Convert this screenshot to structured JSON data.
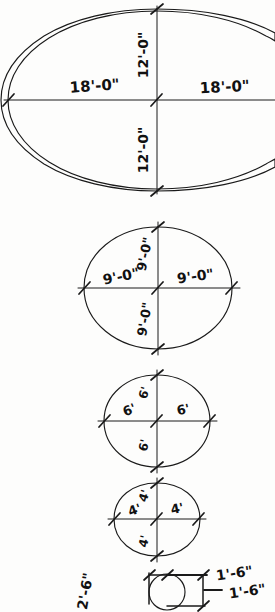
{
  "drawing": {
    "title": "Dimensioned circle series sketch",
    "style": "hand-drawn pencil line drawing",
    "ink_color": "#1a1a1a",
    "paper_color": "#fdfdfc"
  },
  "figures": [
    {
      "id": "figure-1",
      "shape": "ellipse",
      "name": "largest-ellipse",
      "labels": {
        "left": "18'-0\"",
        "right": "18'-0\"",
        "top": "12'-0\"",
        "bottom": "12'-0\""
      }
    },
    {
      "id": "figure-2",
      "shape": "circle",
      "name": "nine-foot-circle",
      "labels": {
        "left": "9'-0\"",
        "right": "9'-0\"",
        "top": "9'-0\"",
        "bottom": "9'-0\""
      }
    },
    {
      "id": "figure-3",
      "shape": "circle",
      "name": "six-foot-circle",
      "labels": {
        "left": "6'",
        "right": "6'",
        "top": "6'",
        "bottom": "6'"
      }
    },
    {
      "id": "figure-4",
      "shape": "circle",
      "name": "four-foot-circle",
      "labels": {
        "left": "4'",
        "right": "4'",
        "top": "4'",
        "bottom": "4'"
      }
    },
    {
      "id": "figure-5",
      "shape": "circle-detail",
      "name": "small-circle-detail",
      "labels": {
        "top": "1'-6\"",
        "right": "1'-6\"",
        "left": "2'-6\""
      }
    }
  ]
}
